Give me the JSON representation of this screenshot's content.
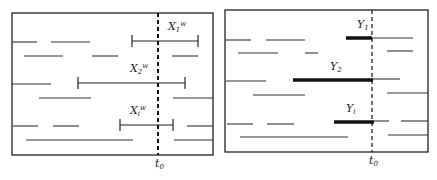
{
  "figure": {
    "panels": [
      {
        "id": "left",
        "box": [
          12,
          13,
          213,
          155
        ],
        "t0_x": 158,
        "t0_label": "t0",
        "intervals": [
          [
            12,
            37,
            42
          ],
          [
            51,
            90,
            42
          ],
          [
            24,
            63,
            56
          ],
          [
            92,
            118,
            56
          ],
          [
            172,
            198,
            56
          ],
          [
            12,
            51,
            84
          ],
          [
            39,
            91,
            98
          ],
          [
            173,
            213,
            98
          ],
          [
            13,
            38,
            126
          ],
          [
            53,
            79,
            126
          ],
          [
            187,
            213,
            126
          ],
          [
            26,
            133,
            140
          ],
          [
            174,
            213,
            140
          ]
        ],
        "brackets": [
          {
            "label": "X1^w",
            "x1": 132,
            "x2": 198,
            "y": 41,
            "lx": 168,
            "ly": 30
          },
          {
            "label": "X2^w",
            "x1": 78,
            "x2": 185,
            "y": 83,
            "lx": 130,
            "ly": 72
          },
          {
            "label": "Xi^w",
            "x1": 120,
            "x2": 173,
            "y": 125,
            "lx": 130,
            "ly": 114
          }
        ]
      },
      {
        "id": "right",
        "box": [
          225,
          10,
          428,
          152
        ],
        "t0_x": 372,
        "t0_label": "t0",
        "intervals": [
          [
            226,
            251,
            40
          ],
          [
            266,
            305,
            40
          ],
          [
            372,
            413,
            38
          ],
          [
            238,
            278,
            53
          ],
          [
            305,
            318,
            53
          ],
          [
            387,
            413,
            51
          ],
          [
            226,
            266,
            81
          ],
          [
            372,
            400,
            79
          ],
          [
            253,
            305,
            95
          ],
          [
            387,
            428,
            93
          ],
          [
            227,
            253,
            124
          ],
          [
            267,
            294,
            124
          ],
          [
            374,
            389,
            121
          ],
          [
            401,
            428,
            121
          ],
          [
            240,
            348,
            137
          ],
          [
            388,
            428,
            135
          ]
        ],
        "bold": [
          {
            "label": "Y1",
            "x1": 346,
            "x2": 372,
            "y": 38,
            "lx": 357,
            "ly": 28
          },
          {
            "label": "Y2",
            "x1": 293,
            "x2": 373,
            "y": 80,
            "lx": 330,
            "ly": 70
          },
          {
            "label": "Yi",
            "x1": 334,
            "x2": 374,
            "y": 122,
            "lx": 346,
            "ly": 112
          }
        ]
      }
    ]
  }
}
